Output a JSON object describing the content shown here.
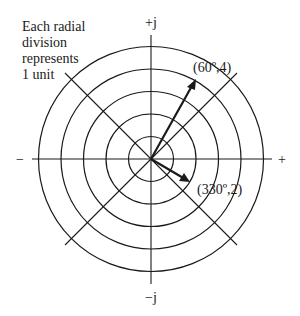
{
  "note": {
    "lines": [
      "Each radial",
      "division",
      "represents",
      "1 unit"
    ]
  },
  "axes": {
    "positive_imag": "+j",
    "negative_imag": "−j",
    "positive_real": "+",
    "negative_real": "−"
  },
  "grid": {
    "center": [
      151,
      159
    ],
    "unit_px": 22.5,
    "rings": [
      1,
      2,
      3,
      4,
      5
    ],
    "diagonal_half_extent": 86
  },
  "vectors": [
    {
      "label": "(60º,4)",
      "angle_deg": 60,
      "magnitude": 4
    },
    {
      "label": "(330º,2)",
      "angle_deg": 330,
      "magnitude": 2
    }
  ],
  "colors": {
    "ink": "#1a1a1a",
    "background": "#ffffff"
  }
}
